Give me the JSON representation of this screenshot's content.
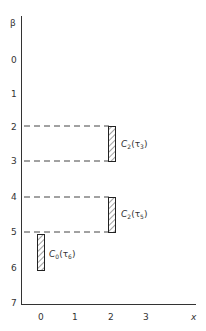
{
  "diagram": {
    "y_axis": {
      "label": "β",
      "ticks": [
        "0",
        "1",
        "2",
        "3",
        "4",
        "5",
        "6",
        "7"
      ]
    },
    "x_axis": {
      "label": "x",
      "ticks": [
        "0",
        "1",
        "2",
        "3"
      ]
    },
    "bars": [
      {
        "label": "C",
        "subscript": "2",
        "arg": "τ",
        "arg_sub": "3",
        "x": 2,
        "beta_from": 2,
        "beta_to": 3
      },
      {
        "label": "C",
        "subscript": "2",
        "arg": "τ",
        "arg_sub": "5",
        "x": 2,
        "beta_from": 4,
        "beta_to": 5
      },
      {
        "label": "C",
        "subscript": "0",
        "arg": "τ",
        "arg_sub": "6",
        "x": 0,
        "beta_from": 5,
        "beta_to": 6
      }
    ],
    "dashed_lines_at_beta": [
      2,
      3,
      4,
      5
    ]
  }
}
